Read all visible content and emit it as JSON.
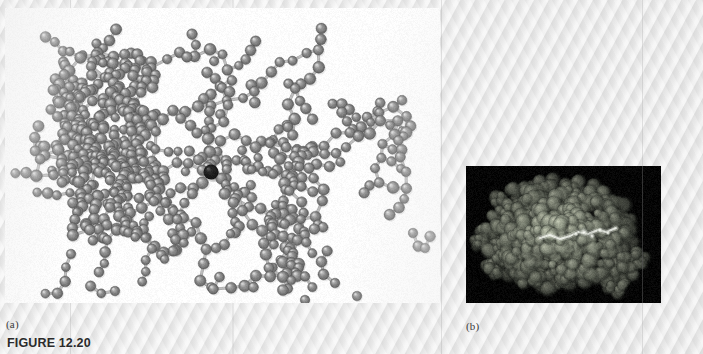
{
  "figure": {
    "caption": "FIGURE 12.20",
    "panel_a_label": "(a)",
    "panel_b_label": "(b)"
  },
  "panel_a": {
    "name": "ball-and-stick-model",
    "description": "Ball-and-stick representation of a protein molecule",
    "background_color": "#fdfdfd",
    "atom_color": "#9a9a9a",
    "atom_highlight_color": "#d8d8d8",
    "atom_edge_color": "#5f5f5f",
    "bond_color": "#bdbdbd",
    "highlighted_atom_color": "#141414",
    "highlighted_atom": {
      "x": 206,
      "y": 164,
      "r": 7.5
    },
    "atom_count": 520,
    "rect": {
      "left": 5,
      "top": 8,
      "width": 435,
      "height": 295
    }
  },
  "panel_b": {
    "name": "space-filling-model",
    "description": "Space-filling representation of the same protein molecule",
    "background_color": "#050505",
    "blob_color": "#5c6258",
    "ligand_color": "#e8ece4",
    "rect": {
      "left": 466,
      "top": 166,
      "width": 195,
      "height": 137
    },
    "band_x": 176
  },
  "page": {
    "background_color": "#e9e9e9",
    "streaks": [
      70,
      232,
      441,
      642
    ]
  }
}
